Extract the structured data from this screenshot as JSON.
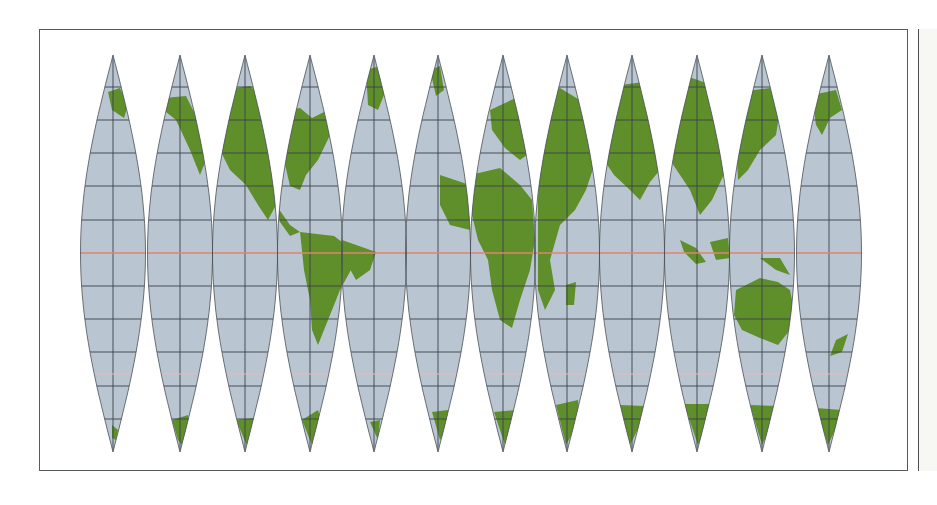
{
  "map": {
    "title": "",
    "projection": "Interrupted sinusoidal globe gores",
    "gore_count": 12,
    "gore_width_deg": 30,
    "graticule_spacing_deg": 15,
    "gore_centers_x": [
      113,
      180,
      245,
      310,
      374,
      438,
      503,
      567,
      632,
      697,
      762,
      829
    ],
    "gore_half_width_px": 32.5,
    "equator_y": 253,
    "north_tip_y": 55,
    "south_tip_y": 452,
    "latitude_lines_y": [
      87,
      120,
      153,
      186,
      220,
      286,
      319,
      352,
      386,
      419
    ],
    "special_lines": {
      "equator": {
        "y": 253,
        "color": "#e0826e"
      },
      "southern_line": {
        "y": 374,
        "color": "#e9b8c0"
      }
    },
    "colors": {
      "ocean": "#b9c6d1",
      "land": "#5f8f2b",
      "graticule": "#3b4249",
      "outline": "#4a4f55",
      "frame": "#555a5e"
    }
  }
}
